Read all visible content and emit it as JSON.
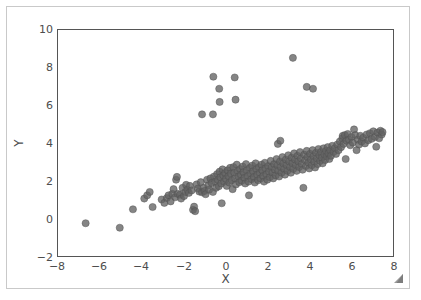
{
  "figure": {
    "background_color": "#ffffff",
    "border_color": "#c9c9c9",
    "axis_color": "#555555",
    "resize_grip_name": "resize-grip-icon"
  },
  "chart_data": {
    "type": "scatter",
    "title": "",
    "xlabel": "X",
    "ylabel": "Y",
    "xlim": [
      -8,
      8
    ],
    "ylim": [
      -2,
      10
    ],
    "xticks": [
      -8,
      -6,
      -4,
      -2,
      0,
      2,
      4,
      6,
      8
    ],
    "xtick_labels": [
      "−8",
      "−6",
      "−4",
      "−2",
      "0",
      "2",
      "4",
      "6",
      "8"
    ],
    "yticks": [
      -2,
      0,
      2,
      4,
      6,
      8,
      10
    ],
    "ytick_labels": [
      "−2",
      "0",
      "2",
      "4",
      "6",
      "8",
      "10"
    ],
    "grid": false,
    "legend": null,
    "marker": {
      "shape": "circle",
      "color": "#636363",
      "edge_color": "#4f4f4f",
      "opacity": 0.78,
      "size_px": 7.2
    },
    "series": [
      {
        "name": "observations",
        "points": [
          [
            -6.68,
            -0.26
          ],
          [
            -5.05,
            -0.5
          ],
          [
            -4.42,
            0.48
          ],
          [
            -3.88,
            1.05
          ],
          [
            -3.74,
            1.22
          ],
          [
            -3.62,
            1.4
          ],
          [
            -3.48,
            0.6
          ],
          [
            -3.05,
            1.0
          ],
          [
            -2.92,
            0.82
          ],
          [
            -2.8,
            1.08
          ],
          [
            -2.72,
            1.22
          ],
          [
            -2.62,
            0.9
          ],
          [
            -2.54,
            1.3
          ],
          [
            -2.48,
            1.55
          ],
          [
            -2.4,
            1.12
          ],
          [
            -2.36,
            2.05
          ],
          [
            -2.32,
            2.2
          ],
          [
            -2.28,
            1.3
          ],
          [
            -2.18,
            1.25
          ],
          [
            -2.12,
            1.05
          ],
          [
            -2.05,
            1.62
          ],
          [
            -1.98,
            1.18
          ],
          [
            -1.92,
            1.4
          ],
          [
            -1.88,
            1.78
          ],
          [
            -1.82,
            1.52
          ],
          [
            -1.75,
            1.35
          ],
          [
            -1.7,
            1.72
          ],
          [
            -1.62,
            1.48
          ],
          [
            -1.55,
            0.45
          ],
          [
            -1.5,
            0.62
          ],
          [
            -1.45,
            0.38
          ],
          [
            -1.38,
            1.8
          ],
          [
            -1.32,
            1.58
          ],
          [
            -1.25,
            1.42
          ],
          [
            -1.18,
            1.92
          ],
          [
            -1.12,
            1.38
          ],
          [
            -1.05,
            1.62
          ],
          [
            -1.0,
            1.45
          ],
          [
            -0.95,
            1.28
          ],
          [
            -0.88,
            2.05
          ],
          [
            -0.82,
            1.75
          ],
          [
            -0.78,
            1.52
          ],
          [
            -0.72,
            2.12
          ],
          [
            -0.66,
            1.88
          ],
          [
            -0.6,
            1.4
          ],
          [
            -0.55,
            2.22
          ],
          [
            -0.5,
            1.95
          ],
          [
            -0.45,
            1.62
          ],
          [
            -0.4,
            2.35
          ],
          [
            -0.36,
            2.05
          ],
          [
            -0.32,
            1.7
          ],
          [
            -0.28,
            2.48
          ],
          [
            -0.24,
            2.18
          ],
          [
            -0.2,
            1.85
          ],
          [
            -0.18,
            0.8
          ],
          [
            -0.14,
            2.6
          ],
          [
            -0.1,
            2.28
          ],
          [
            -0.06,
            1.95
          ],
          [
            -0.02,
            2.4
          ],
          [
            0.02,
            2.1
          ],
          [
            0.06,
            1.72
          ],
          [
            0.1,
            2.55
          ],
          [
            0.14,
            2.25
          ],
          [
            0.18,
            1.9
          ],
          [
            0.22,
            2.68
          ],
          [
            0.26,
            2.38
          ],
          [
            0.3,
            2.02
          ],
          [
            0.34,
            1.55
          ],
          [
            0.38,
            2.72
          ],
          [
            0.42,
            2.42
          ],
          [
            0.46,
            2.12
          ],
          [
            0.5,
            1.8
          ],
          [
            0.54,
            2.85
          ],
          [
            0.58,
            2.52
          ],
          [
            0.62,
            2.22
          ],
          [
            0.66,
            1.92
          ],
          [
            0.7,
            2.62
          ],
          [
            0.74,
            2.32
          ],
          [
            0.78,
            2.0
          ],
          [
            0.82,
            2.75
          ],
          [
            0.86,
            2.45
          ],
          [
            0.9,
            2.15
          ],
          [
            0.94,
            1.85
          ],
          [
            0.98,
            2.88
          ],
          [
            1.02,
            2.55
          ],
          [
            1.06,
            2.25
          ],
          [
            1.1,
            1.95
          ],
          [
            1.12,
            1.22
          ],
          [
            1.16,
            2.68
          ],
          [
            1.2,
            2.38
          ],
          [
            1.24,
            2.08
          ],
          [
            1.28,
            2.8
          ],
          [
            1.32,
            2.5
          ],
          [
            1.36,
            2.2
          ],
          [
            1.4,
            1.9
          ],
          [
            1.44,
            2.92
          ],
          [
            1.48,
            2.62
          ],
          [
            1.52,
            2.32
          ],
          [
            1.56,
            2.02
          ],
          [
            1.6,
            2.72
          ],
          [
            1.64,
            2.42
          ],
          [
            1.68,
            2.12
          ],
          [
            1.72,
            2.85
          ],
          [
            1.76,
            2.55
          ],
          [
            1.8,
            2.25
          ],
          [
            1.84,
            1.95
          ],
          [
            1.88,
            2.95
          ],
          [
            1.92,
            2.65
          ],
          [
            1.96,
            2.35
          ],
          [
            2.0,
            2.05
          ],
          [
            2.04,
            2.78
          ],
          [
            2.08,
            2.48
          ],
          [
            2.12,
            2.18
          ],
          [
            2.16,
            3.05
          ],
          [
            2.2,
            2.72
          ],
          [
            2.24,
            2.42
          ],
          [
            2.28,
            2.12
          ],
          [
            2.32,
            2.88
          ],
          [
            2.36,
            2.58
          ],
          [
            2.4,
            2.28
          ],
          [
            2.44,
            3.15
          ],
          [
            2.48,
            2.82
          ],
          [
            2.5,
            3.95
          ],
          [
            2.52,
            2.52
          ],
          [
            2.56,
            2.22
          ],
          [
            2.6,
            3.02
          ],
          [
            2.62,
            4.12
          ],
          [
            2.64,
            2.72
          ],
          [
            2.68,
            2.42
          ],
          [
            2.72,
            3.25
          ],
          [
            2.76,
            2.92
          ],
          [
            2.8,
            2.62
          ],
          [
            2.84,
            2.32
          ],
          [
            2.88,
            3.12
          ],
          [
            2.92,
            2.82
          ],
          [
            2.96,
            2.52
          ],
          [
            3.0,
            3.35
          ],
          [
            3.04,
            3.02
          ],
          [
            3.08,
            2.72
          ],
          [
            3.12,
            2.42
          ],
          [
            3.16,
            3.22
          ],
          [
            3.2,
            2.92
          ],
          [
            3.24,
            2.62
          ],
          [
            3.28,
            3.45
          ],
          [
            3.32,
            3.12
          ],
          [
            3.36,
            2.82
          ],
          [
            3.4,
            2.52
          ],
          [
            3.44,
            3.32
          ],
          [
            3.48,
            3.02
          ],
          [
            3.52,
            2.72
          ],
          [
            3.56,
            3.52
          ],
          [
            3.6,
            3.18
          ],
          [
            3.64,
            2.88
          ],
          [
            3.68,
            2.58
          ],
          [
            3.72,
            1.62
          ],
          [
            3.76,
            3.38
          ],
          [
            3.8,
            3.08
          ],
          [
            3.84,
            2.78
          ],
          [
            3.88,
            3.58
          ],
          [
            3.92,
            3.25
          ],
          [
            3.96,
            2.95
          ],
          [
            4.0,
            2.65
          ],
          [
            4.04,
            3.42
          ],
          [
            4.08,
            3.12
          ],
          [
            4.12,
            2.82
          ],
          [
            4.16,
            3.62
          ],
          [
            4.2,
            3.3
          ],
          [
            4.24,
            3.0
          ],
          [
            4.28,
            2.7
          ],
          [
            4.32,
            3.48
          ],
          [
            4.36,
            3.18
          ],
          [
            4.4,
            2.88
          ],
          [
            4.44,
            3.68
          ],
          [
            4.48,
            3.35
          ],
          [
            4.52,
            3.05
          ],
          [
            4.56,
            3.52
          ],
          [
            4.6,
            3.22
          ],
          [
            4.64,
            2.92
          ],
          [
            4.68,
            3.72
          ],
          [
            4.72,
            3.4
          ],
          [
            4.76,
            3.1
          ],
          [
            4.8,
            3.58
          ],
          [
            4.84,
            3.28
          ],
          [
            4.88,
            3.78
          ],
          [
            4.92,
            3.45
          ],
          [
            4.96,
            3.15
          ],
          [
            5.0,
            3.62
          ],
          [
            5.04,
            3.32
          ],
          [
            5.1,
            3.85
          ],
          [
            5.16,
            3.52
          ],
          [
            5.22,
            3.72
          ],
          [
            5.28,
            3.42
          ],
          [
            5.34,
            3.92
          ],
          [
            5.4,
            3.62
          ],
          [
            5.46,
            4.08
          ],
          [
            5.52,
            3.78
          ],
          [
            5.58,
            4.25
          ],
          [
            5.6,
            4.38
          ],
          [
            5.64,
            3.95
          ],
          [
            5.7,
            4.42
          ],
          [
            5.74,
            3.15
          ],
          [
            5.78,
            4.12
          ],
          [
            5.84,
            4.48
          ],
          [
            5.9,
            4.18
          ],
          [
            5.96,
            3.88
          ],
          [
            6.02,
            4.32
          ],
          [
            6.08,
            4.02
          ],
          [
            6.14,
            4.72
          ],
          [
            6.2,
            4.42
          ],
          [
            6.26,
            3.62
          ],
          [
            6.32,
            4.18
          ],
          [
            6.38,
            3.92
          ],
          [
            6.44,
            4.38
          ],
          [
            6.5,
            4.08
          ],
          [
            6.58,
            4.28
          ],
          [
            6.66,
            3.98
          ],
          [
            6.74,
            4.45
          ],
          [
            6.82,
            4.15
          ],
          [
            6.9,
            4.52
          ],
          [
            6.98,
            4.22
          ],
          [
            7.06,
            4.62
          ],
          [
            7.14,
            4.32
          ],
          [
            7.2,
            3.8
          ],
          [
            7.26,
            4.55
          ],
          [
            7.34,
            4.25
          ],
          [
            7.4,
            4.65
          ],
          [
            7.46,
            4.45
          ],
          [
            7.5,
            4.58
          ],
          [
            -1.12,
            5.52
          ],
          [
            -0.6,
            5.52
          ],
          [
            -0.58,
            7.52
          ],
          [
            -0.3,
            6.88
          ],
          [
            -0.28,
            6.18
          ],
          [
            0.44,
            7.48
          ],
          [
            0.48,
            6.3
          ],
          [
            3.22,
            8.52
          ],
          [
            3.88,
            6.98
          ],
          [
            4.18,
            6.88
          ]
        ]
      }
    ]
  }
}
